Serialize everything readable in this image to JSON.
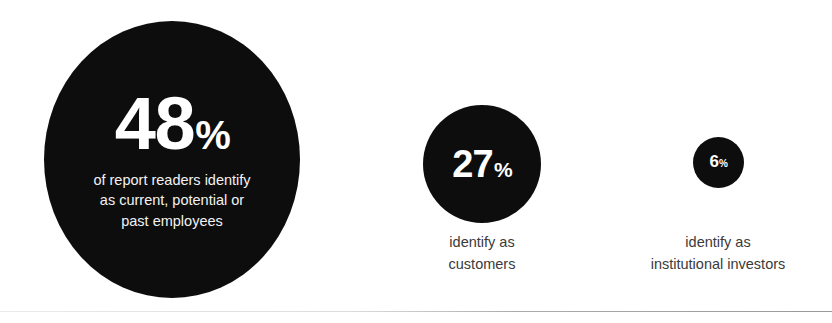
{
  "figure": {
    "background_color": "#ffffff",
    "bubble_color": "#0d0d0d",
    "bubble_text_color": "#ffffff",
    "caption_color": "#3a3a3a"
  },
  "chart_data": {
    "type": "pie",
    "title": "",
    "subtitle": "",
    "xlabel": "",
    "ylabel": "",
    "legend_position": "none",
    "grid": false,
    "units": "percent",
    "categories": [
      "report readers identify as current, potential or past employees",
      "identify as customers",
      "identify as institutional investors"
    ],
    "values": [
      48,
      27,
      6
    ],
    "annotations": [
      "48% of report readers identify as current, potential or past employees",
      "27% identify as customers",
      "6% identify as institutional investors"
    ]
  },
  "stats": [
    {
      "id": "primary",
      "number": "48",
      "percent_symbol": "%",
      "caption_line_1": "of report readers identify",
      "caption_line_2": "as current, potential or",
      "caption_line_3": "past employees",
      "caption_placement": "inside"
    },
    {
      "id": "secondary",
      "number": "27",
      "percent_symbol": "%",
      "caption_line_1": "identify as",
      "caption_line_2": "customers",
      "caption_placement": "below"
    },
    {
      "id": "tertiary",
      "number": "6",
      "percent_symbol": "%",
      "caption_line_1": "identify as",
      "caption_line_2": "institutional investors",
      "caption_placement": "below"
    }
  ]
}
